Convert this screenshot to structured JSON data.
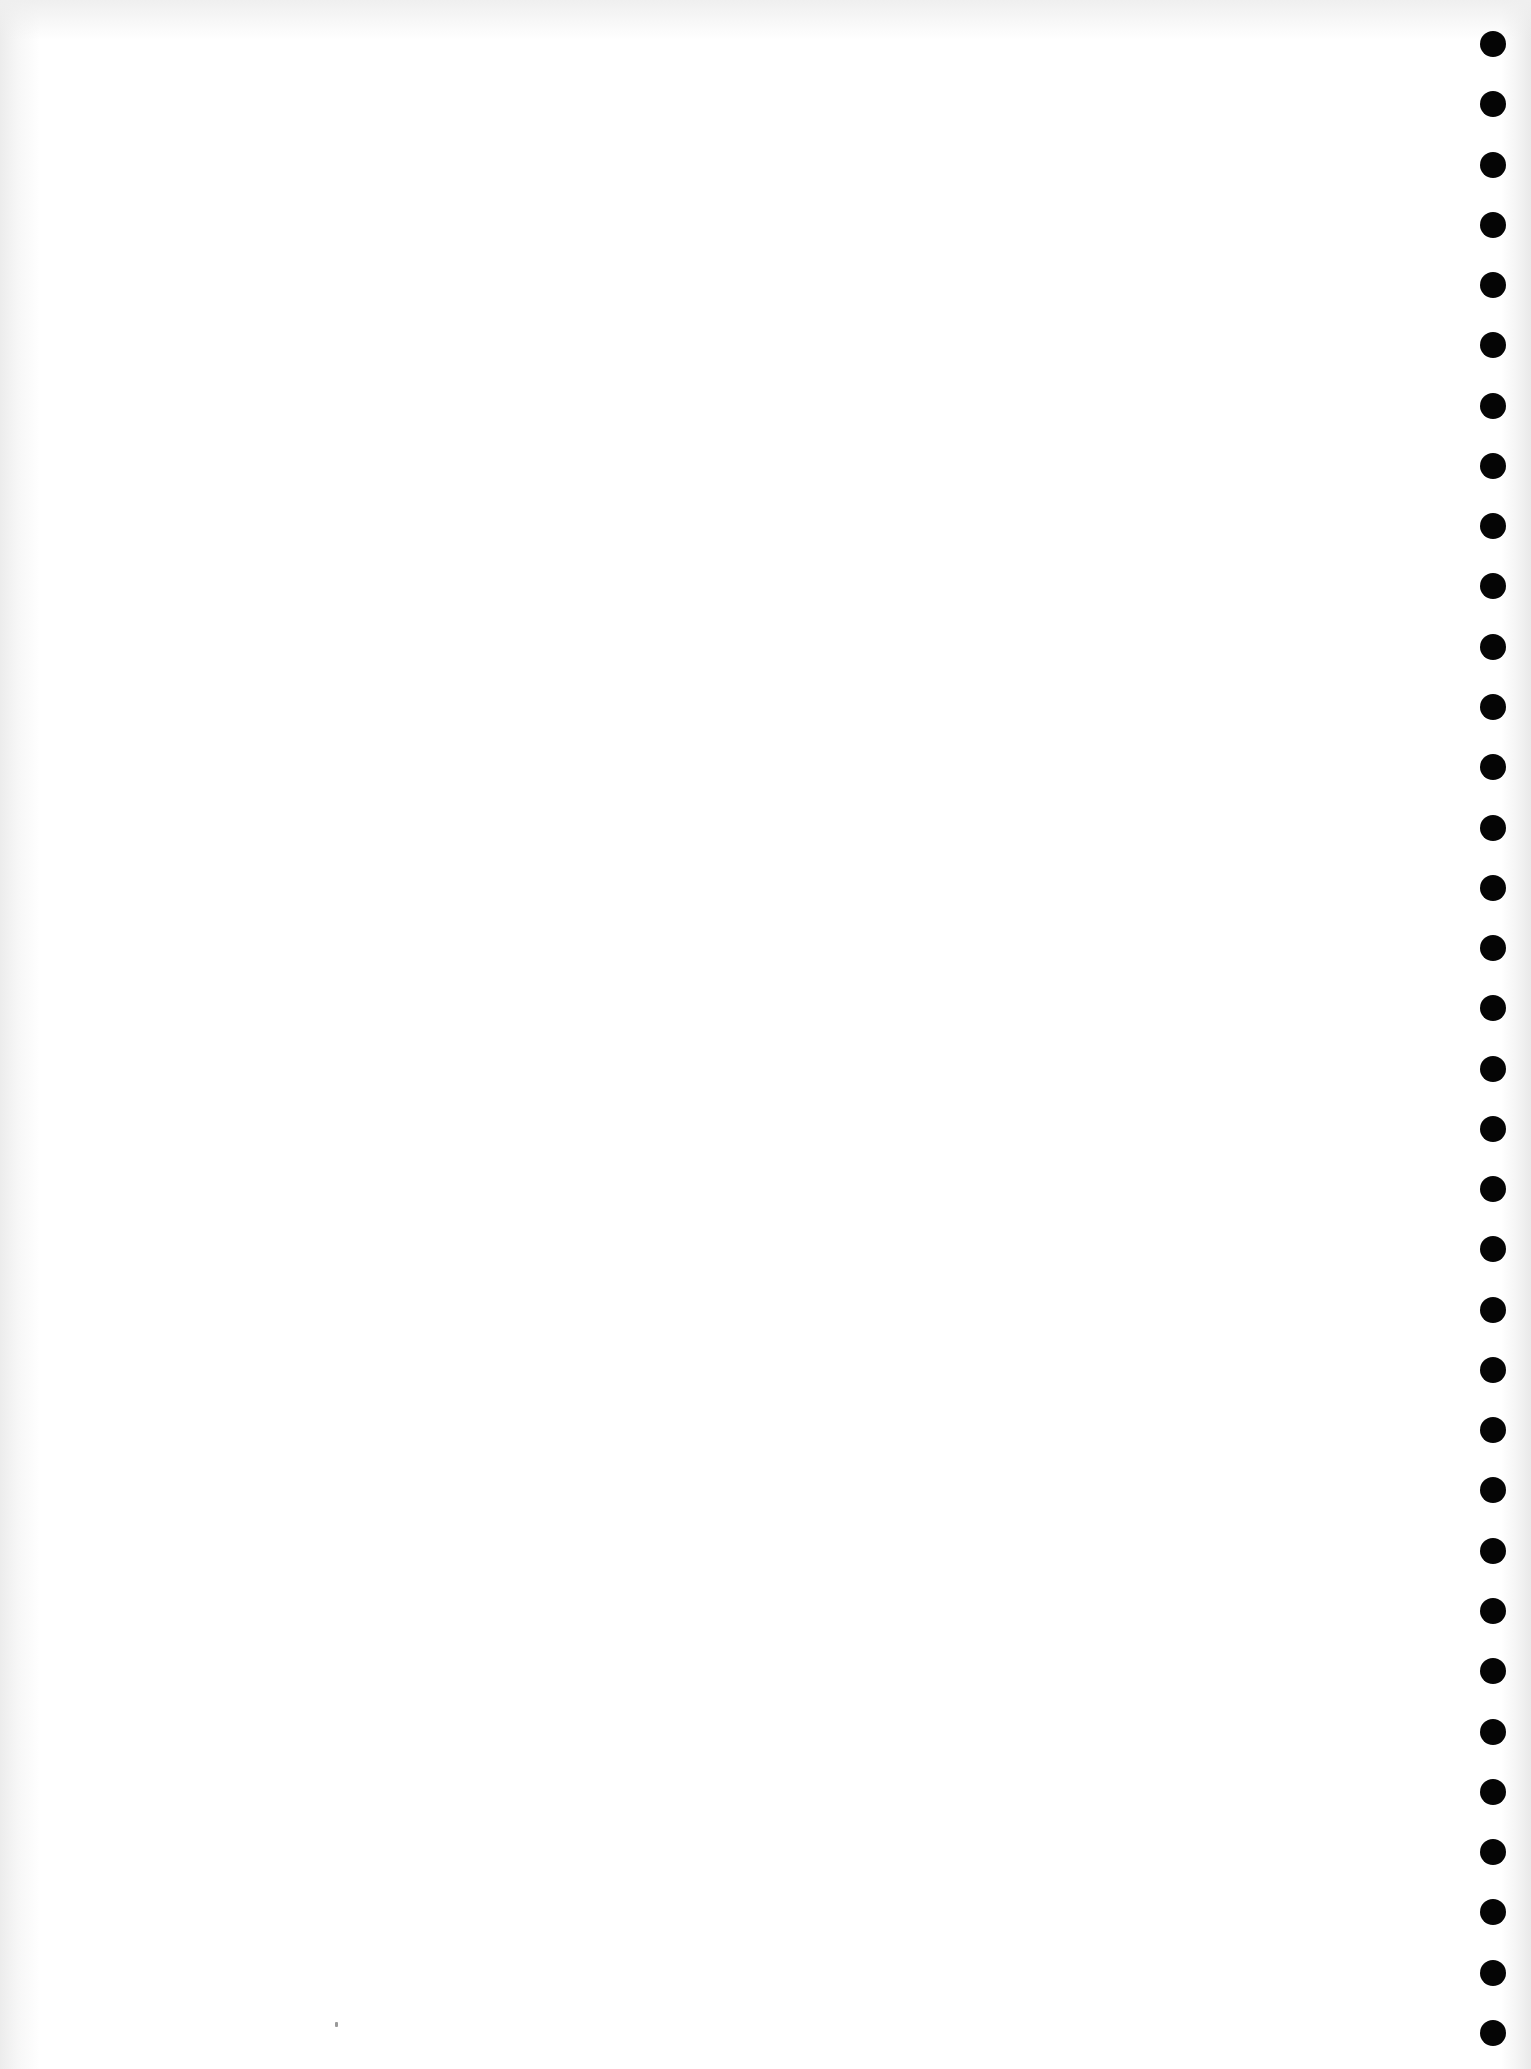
{
  "page": {
    "type": "blank-punched-sheet",
    "background_color": "#ffffff",
    "text_content": ""
  },
  "punch_holes": {
    "count": 34,
    "color": "#050505",
    "diameter_px": 26,
    "center_x_px": 1493,
    "first_center_y_px": 44,
    "spacing_px": 60.27
  }
}
